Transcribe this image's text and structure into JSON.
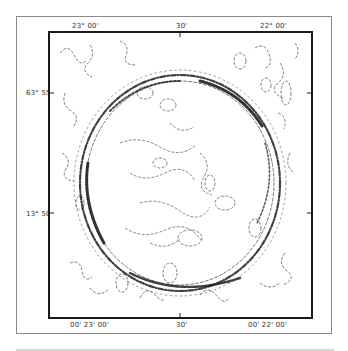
{
  "map": {
    "top_axis_labels": [
      {
        "text": "23° 00'",
        "x": 72
      },
      {
        "text": "30'",
        "x": 176
      },
      {
        "text": "22° 00'",
        "x": 260
      }
    ],
    "bottom_axis_labels": [
      {
        "text": "00' 23' 00'",
        "x": 70
      },
      {
        "text": "30'",
        "x": 176
      },
      {
        "text": "00' 22' 00'",
        "x": 248
      }
    ],
    "left_axis_labels": [
      {
        "text": "63° 55'",
        "y": 93
      },
      {
        "text": "13° 50'",
        "y": 214
      }
    ],
    "colors": {
      "frame": "#8a8a8a",
      "map_border": "#1a1a1a",
      "contour": "#2a2a2a",
      "label": "#333333",
      "bottom_band": "#d6d6d6"
    },
    "feature": "circular ring structure of dense contour lines"
  }
}
